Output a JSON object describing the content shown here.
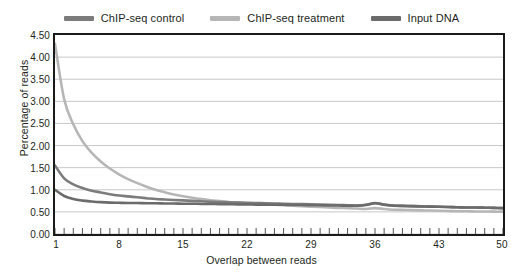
{
  "chart_data": {
    "type": "line",
    "title": "",
    "xlabel": "Overlap between reads",
    "ylabel": "Percentage of reads",
    "xlim": [
      1,
      50
    ],
    "ylim": [
      0.0,
      4.5
    ],
    "yticks": [
      "0.00",
      "0.50",
      "1.00",
      "1.50",
      "2.00",
      "2.50",
      "3.00",
      "3.50",
      "4.00",
      "4.50"
    ],
    "ytick_values": [
      0.0,
      0.5,
      1.0,
      1.5,
      2.0,
      2.5,
      3.0,
      3.5,
      4.0,
      4.5
    ],
    "xticks": [
      "1",
      "8",
      "15",
      "22",
      "29",
      "36",
      "43",
      "50"
    ],
    "xtick_values": [
      1,
      8,
      15,
      22,
      29,
      36,
      43,
      50
    ],
    "grid": "horizontal",
    "legend_position": "top-center",
    "x": [
      1,
      2,
      3,
      4,
      5,
      6,
      7,
      8,
      9,
      10,
      11,
      12,
      13,
      14,
      15,
      16,
      17,
      18,
      19,
      20,
      21,
      22,
      23,
      24,
      25,
      26,
      27,
      28,
      29,
      30,
      31,
      32,
      33,
      34,
      35,
      36,
      37,
      38,
      39,
      40,
      41,
      42,
      43,
      44,
      45,
      46,
      47,
      48,
      49,
      50
    ],
    "series": [
      {
        "name": "ChIP-seq control",
        "color": "#7c7c7c",
        "values": [
          1.55,
          1.26,
          1.12,
          1.04,
          0.98,
          0.94,
          0.9,
          0.87,
          0.85,
          0.83,
          0.81,
          0.79,
          0.78,
          0.77,
          0.76,
          0.75,
          0.74,
          0.73,
          0.72,
          0.715,
          0.71,
          0.705,
          0.7,
          0.695,
          0.69,
          0.685,
          0.68,
          0.675,
          0.67,
          0.665,
          0.66,
          0.655,
          0.65,
          0.645,
          0.66,
          0.7,
          0.665,
          0.645,
          0.635,
          0.63,
          0.625,
          0.62,
          0.615,
          0.61,
          0.605,
          0.6,
          0.6,
          0.595,
          0.59,
          0.585
        ]
      },
      {
        "name": "ChIP-seq treatment",
        "color": "#b6b6b6",
        "values": [
          4.3,
          3.05,
          2.48,
          2.1,
          1.84,
          1.64,
          1.48,
          1.35,
          1.24,
          1.15,
          1.07,
          1.0,
          0.945,
          0.895,
          0.855,
          0.82,
          0.79,
          0.765,
          0.745,
          0.725,
          0.71,
          0.695,
          0.68,
          0.67,
          0.66,
          0.65,
          0.64,
          0.63,
          0.62,
          0.61,
          0.6,
          0.59,
          0.585,
          0.575,
          0.565,
          0.585,
          0.565,
          0.55,
          0.545,
          0.54,
          0.535,
          0.53,
          0.525,
          0.52,
          0.515,
          0.515,
          0.51,
          0.51,
          0.505,
          0.505
        ]
      },
      {
        "name": "Input DNA",
        "color": "#6b6b6b",
        "values": [
          1.0,
          0.86,
          0.79,
          0.755,
          0.735,
          0.72,
          0.71,
          0.705,
          0.7,
          0.7,
          0.695,
          0.695,
          0.69,
          0.69,
          0.685,
          0.685,
          0.68,
          0.68,
          0.675,
          0.675,
          0.67,
          0.67,
          0.665,
          0.665,
          0.66,
          0.66,
          0.655,
          0.655,
          0.65,
          0.65,
          0.645,
          0.645,
          0.64,
          0.64,
          0.655,
          0.695,
          0.66,
          0.64,
          0.635,
          0.63,
          0.625,
          0.62,
          0.615,
          0.61,
          0.605,
          0.6,
          0.6,
          0.595,
          0.59,
          0.585
        ]
      }
    ]
  },
  "legend": {
    "items": [
      {
        "label": "ChIP-seq control",
        "color": "#7c7c7c"
      },
      {
        "label": "ChIP-seq treatment",
        "color": "#b6b6b6"
      },
      {
        "label": "Input DNA",
        "color": "#6b6b6b"
      }
    ]
  },
  "axes": {
    "x_title": "Overlap between reads",
    "y_title": "Percentage of reads"
  },
  "colors": {
    "frame": "#1a1a1a",
    "grid": "#c8c8c8",
    "text": "#231f20",
    "background": "#ffffff"
  }
}
